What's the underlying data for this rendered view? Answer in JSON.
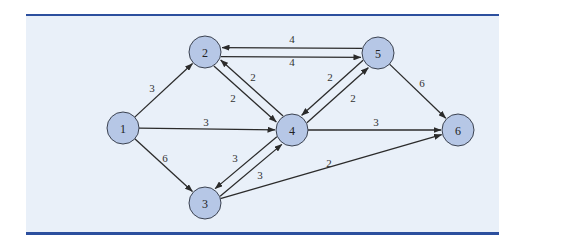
{
  "diagram": {
    "type": "directed-network",
    "colors": {
      "rule": "#2c4f9e",
      "panel": "#e9f0f9",
      "node_fill": "#b6c7e6",
      "node_stroke": "#3b4250",
      "edge": "#2b2b2b"
    },
    "nodes": [
      {
        "id": "1",
        "label": "1",
        "x": 123,
        "y": 128
      },
      {
        "id": "2",
        "label": "2",
        "x": 205,
        "y": 52
      },
      {
        "id": "3",
        "label": "3",
        "x": 205,
        "y": 203
      },
      {
        "id": "4",
        "label": "4",
        "x": 292,
        "y": 130
      },
      {
        "id": "5",
        "label": "5",
        "x": 378,
        "y": 53
      },
      {
        "id": "6",
        "label": "6",
        "x": 458,
        "y": 130
      }
    ],
    "edges": [
      {
        "from": "1",
        "to": "2",
        "weight": "3",
        "lx": 152,
        "ly": 88
      },
      {
        "from": "1",
        "to": "4",
        "weight": "3",
        "lx": 206,
        "ly": 122
      },
      {
        "from": "1",
        "to": "3",
        "weight": "6",
        "lx": 165,
        "ly": 158
      },
      {
        "from": "2",
        "to": "5",
        "weight": "4",
        "lx": 292,
        "ly": 39
      },
      {
        "from": "5",
        "to": "2",
        "weight": "4",
        "lx": 292,
        "ly": 62
      },
      {
        "from": "2",
        "to": "4",
        "weight": "2",
        "lx": 233,
        "ly": 98
      },
      {
        "from": "4",
        "to": "2",
        "weight": "2",
        "lx": 253,
        "ly": 77
      },
      {
        "from": "5",
        "to": "4",
        "weight": "2",
        "lx": 330,
        "ly": 77
      },
      {
        "from": "4",
        "to": "5",
        "weight": "2",
        "lx": 353,
        "ly": 98
      },
      {
        "from": "5",
        "to": "6",
        "weight": "6",
        "lx": 422,
        "ly": 83
      },
      {
        "from": "4",
        "to": "6",
        "weight": "3",
        "lx": 376,
        "ly": 122
      },
      {
        "from": "4",
        "to": "3",
        "weight": "3",
        "lx": 235,
        "ly": 158
      },
      {
        "from": "3",
        "to": "4",
        "weight": "3",
        "lx": 260,
        "ly": 175
      },
      {
        "from": "3",
        "to": "6",
        "weight": "2",
        "lx": 329,
        "ly": 163
      }
    ]
  }
}
